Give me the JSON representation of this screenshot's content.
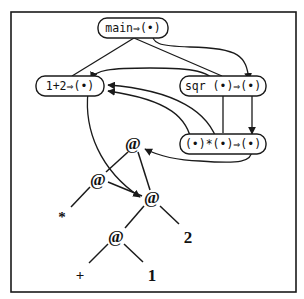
{
  "diagram": {
    "type": "graph-reduction-diagram",
    "nodes": [
      {
        "id": "main",
        "label": "main⇒(•)"
      },
      {
        "id": "onetwo",
        "label": "1+2⇒(•)"
      },
      {
        "id": "sqr",
        "label": "sqr (•)⇒(•)"
      },
      {
        "id": "mul",
        "label": "(•)*(•)⇒(•)"
      }
    ],
    "tree": {
      "app_symbol": "@",
      "leaves": {
        "star": "*",
        "plus": "+",
        "one": "1",
        "two": "2"
      }
    },
    "colors": {
      "ink": "#1a1a1a",
      "background": "#ffffff"
    }
  }
}
